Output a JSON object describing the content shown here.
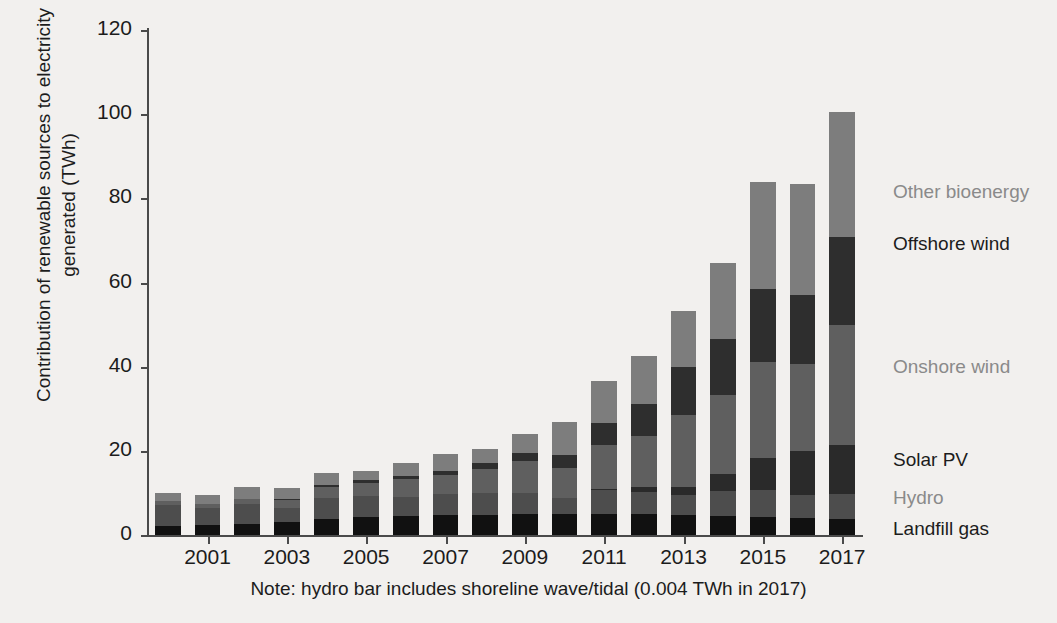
{
  "chart_data": {
    "type": "bar",
    "subtype": "stacked-bar",
    "title": "",
    "xlabel": "",
    "ylabel": "Contribution of renewable sources to electricity generated (TWh)",
    "ylim": [
      0,
      120
    ],
    "yticks": [
      0,
      20,
      40,
      60,
      80,
      100,
      120
    ],
    "grid": false,
    "legend_position": "right-direct-labels",
    "categories": [
      "2000",
      "2001",
      "2002",
      "2003",
      "2004",
      "2005",
      "2006",
      "2007",
      "2008",
      "2009",
      "2010",
      "2011",
      "2012",
      "2013",
      "2014",
      "2015",
      "2016",
      "2017"
    ],
    "xtick_labels": [
      "2001",
      "2003",
      "2005",
      "2007",
      "2009",
      "2011",
      "2013",
      "2015",
      "2017"
    ],
    "series": [
      {
        "name": "Landfill gas",
        "color": "#111111",
        "values": [
          2.1,
          2.3,
          2.5,
          3.2,
          3.9,
          4.3,
          4.5,
          4.7,
          4.8,
          5.0,
          5.1,
          5.1,
          5.0,
          4.8,
          4.6,
          4.3,
          4.1,
          3.9
        ]
      },
      {
        "name": "Hydro",
        "color": "#4d4d4d",
        "values": [
          5.1,
          4.1,
          4.8,
          3.2,
          4.8,
          4.9,
          4.6,
          5.1,
          5.1,
          5.1,
          3.6,
          5.7,
          5.3,
          4.7,
          5.9,
          6.3,
          5.4,
          5.9
        ]
      },
      {
        "name": "Solar PV",
        "color": "#2a2a2a",
        "values": [
          0.0,
          0.0,
          0.0,
          0.0,
          0.0,
          0.0,
          0.0,
          0.0,
          0.0,
          0.0,
          0.0,
          0.2,
          1.2,
          2.0,
          4.1,
          7.6,
          10.4,
          11.5
        ]
      },
      {
        "name": "Onshore wind",
        "color": "#5f5f5f",
        "values": [
          0.9,
          1.0,
          1.3,
          1.9,
          2.6,
          3.2,
          4.2,
          4.5,
          5.8,
          7.6,
          7.2,
          10.5,
          12.1,
          17.0,
          18.6,
          22.9,
          20.8,
          28.7
        ]
      },
      {
        "name": "Offshore wind",
        "color": "#2e2e2e",
        "values": [
          0.0,
          0.0,
          0.0,
          0.3,
          0.6,
          0.7,
          0.7,
          0.8,
          1.3,
          1.8,
          3.1,
          5.1,
          7.6,
          11.5,
          13.4,
          17.4,
          16.4,
          20.9
        ]
      },
      {
        "name": "Other bioenergy",
        "color": "#7d7d7d",
        "values": [
          2.0,
          2.2,
          2.7,
          2.5,
          2.9,
          2.0,
          3.1,
          4.2,
          3.4,
          4.6,
          7.8,
          10.0,
          11.3,
          13.3,
          18.0,
          25.4,
          26.4,
          29.6
        ]
      }
    ],
    "totals": [
      10.1,
      9.6,
      11.3,
      11.1,
      14.8,
      15.1,
      17.1,
      19.3,
      20.4,
      24.1,
      26.8,
      36.6,
      42.5,
      53.3,
      64.6,
      83.9,
      83.5,
      100.5
    ],
    "note": "Note: hydro bar includes shoreline wave/tidal (0.004 TWh in 2017)"
  },
  "legend_labels": {
    "other_bioenergy": "Other bioenergy",
    "offshore_wind": "Offshore wind",
    "onshore_wind": "Onshore wind",
    "solar_pv": "Solar PV",
    "hydro": "Hydro",
    "landfill_gas": "Landfill gas"
  },
  "colors": {
    "background": "#f2f0ee",
    "axis": "#4a4a4a",
    "text": "#1c1c1c",
    "legend_gray": "#8a8a8a"
  }
}
